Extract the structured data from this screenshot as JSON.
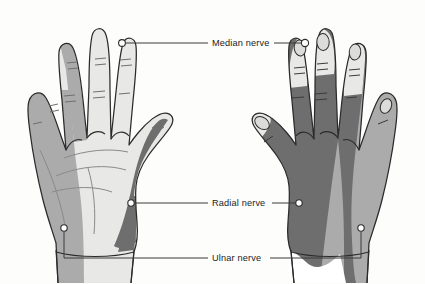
{
  "figure": {
    "background_color": "#fdfdfc",
    "outline_color": "#2b2b2b"
  },
  "palette": {
    "median_territory": "#e8e8e6",
    "ulnar_territory": "#ababab",
    "radial_territory": "#6e6e6e",
    "nail_fill": "#dcdcda",
    "crease_line": "#8a8a8a",
    "marker_fill": "#ffffff",
    "marker_stroke": "#2b2b2b",
    "leader_line": "#3a3a3a"
  },
  "views": [
    {
      "id": "palmar",
      "name": "left-hand-palmar-view",
      "aspect": "Palmar (volar) surface",
      "side": "left"
    },
    {
      "id": "dorsal",
      "name": "right-hand-dorsal-view",
      "aspect": "Dorsal surface",
      "side": "right"
    }
  ],
  "labels": {
    "median": {
      "text": "Median nerve",
      "x": 212,
      "y": 45,
      "color": "#e8e8e6"
    },
    "radial": {
      "text": "Radial nerve",
      "x": 212,
      "y": 205,
      "color": "#6e6e6e"
    },
    "ulnar": {
      "text": "Ulnar nerve",
      "x": 212,
      "y": 260,
      "color": "#ababab"
    }
  },
  "markers": [
    {
      "name": "median-marker-palmar-index",
      "cx": 122,
      "cy": 43,
      "r": 3.4
    },
    {
      "name": "median-marker-dorsal-index",
      "cx": 305,
      "cy": 43,
      "r": 3.6
    },
    {
      "name": "radial-marker-palmar-thenar",
      "cx": 131,
      "cy": 203,
      "r": 3.2
    },
    {
      "name": "radial-marker-dorsal-web",
      "cx": 299,
      "cy": 203,
      "r": 3.2
    },
    {
      "name": "ulnar-marker-palmar-wrist",
      "cx": 64,
      "cy": 228,
      "r": 3.2
    },
    {
      "name": "ulnar-marker-dorsal-wrist",
      "cx": 361,
      "cy": 228,
      "r": 3.2
    }
  ]
}
